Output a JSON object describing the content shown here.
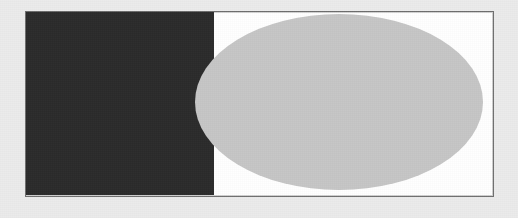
{
  "figure": {
    "canvas": {
      "width": 518,
      "height": 218,
      "background_color": "#ebebeb",
      "texture": "scanned-halftone-noise"
    },
    "frame": {
      "name": "white bordered frame",
      "x": 25,
      "y": 11,
      "width": 469,
      "height": 186,
      "fill_color": "#ffffff",
      "border_color": "#6e6e6e",
      "border_width": 1
    },
    "shapes": [
      {
        "id": "dark-rectangle",
        "type": "rectangle",
        "label": "Dark rectangle",
        "x": 25,
        "y": 11,
        "width": 189,
        "height": 184,
        "fill_color": "#2b2b2b",
        "z_order": 1
      },
      {
        "id": "gray-ellipse",
        "type": "ellipse",
        "label": "Light gray ellipse",
        "center_x": 339,
        "center_y": 102,
        "radius_x": 144,
        "radius_y": 88,
        "x": 195,
        "y": 14,
        "width": 288,
        "height": 176,
        "fill_color": "#c6c6c6",
        "z_order": 2
      }
    ],
    "colors": {
      "background": "#ebebeb",
      "frame_fill": "#ffffff",
      "frame_border": "#6e6e6e",
      "rectangle": "#2b2b2b",
      "ellipse": "#c6c6c6"
    }
  }
}
